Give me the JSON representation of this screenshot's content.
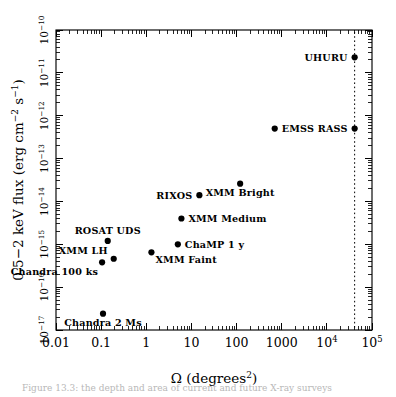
{
  "figure": {
    "background": "#ffffff",
    "ink_color": "#000000",
    "caption_fragment": "Figure  13.3:  the  depth  and  area  of  current  and  future  X-ray  surveys"
  },
  "chart_data": {
    "type": "scatter",
    "title": "",
    "xlabel": "Ω (degrees",
    "xlabel_sup": "2",
    "xlabel_tail": ")",
    "ylabel_prefix": "0.5−2 keV flux (erg cm",
    "ylabel_sup1": "−2",
    "ylabel_mid": " s",
    "ylabel_sup2": "−1",
    "ylabel_tail": ")",
    "xscale": "log",
    "yscale": "log",
    "xlim": [
      0.01,
      100000
    ],
    "ylim": [
      1e-17,
      1e-10
    ],
    "grid": false,
    "legend": false,
    "xticks": [
      {
        "value": 0.01,
        "label": "0.01",
        "sup": ""
      },
      {
        "value": 0.1,
        "label": "0.1",
        "sup": ""
      },
      {
        "value": 1,
        "label": "1",
        "sup": ""
      },
      {
        "value": 10,
        "label": "10",
        "sup": ""
      },
      {
        "value": 100,
        "label": "100",
        "sup": ""
      },
      {
        "value": 1000,
        "label": "1000",
        "sup": ""
      },
      {
        "value": 10000,
        "label": "10",
        "sup": "4"
      },
      {
        "value": 100000,
        "label": "10",
        "sup": "5"
      }
    ],
    "yticks": [
      {
        "value": 1e-17,
        "label": "10",
        "sup": "−17"
      },
      {
        "value": 1e-16,
        "label": "10",
        "sup": "−16"
      },
      {
        "value": 1e-15,
        "label": "10",
        "sup": "−15"
      },
      {
        "value": 1e-14,
        "label": "10",
        "sup": "−14"
      },
      {
        "value": 1e-13,
        "label": "10",
        "sup": "−13"
      },
      {
        "value": 1e-12,
        "label": "10",
        "sup": "−12"
      },
      {
        "value": 1e-11,
        "label": "10",
        "sup": "−11"
      },
      {
        "value": 1e-10,
        "label": "10",
        "sup": "−10"
      }
    ],
    "annotations": [
      {
        "name": "fullsky-line",
        "type": "vline",
        "x": 41253,
        "style": "dotted",
        "label": ""
      }
    ],
    "points": [
      {
        "name": "Chandra 2 Ms",
        "x": 0.11,
        "y": 2.4e-17,
        "label": "Chandra 2 Ms",
        "label_pos": "below"
      },
      {
        "name": "Chandra 100 ks",
        "x": 0.105,
        "y": 3.8e-16,
        "label": "Chandra 100 ks",
        "label_pos": "below-left"
      },
      {
        "name": "XMM LH",
        "x": 0.19,
        "y": 4.6e-16,
        "label": "XMM LH",
        "label_pos": "above-left"
      },
      {
        "name": "ROSAT UDS",
        "x": 0.14,
        "y": 1.2e-15,
        "label": "ROSAT UDS",
        "label_pos": "above"
      },
      {
        "name": "XMM Faint",
        "x": 1.3,
        "y": 6.5e-16,
        "label": "XMM Faint",
        "label_pos": "below-right"
      },
      {
        "name": "ChaMP 1 y",
        "x": 5.0,
        "y": 1e-15,
        "label": "ChaMP 1 y",
        "label_pos": "right"
      },
      {
        "name": "XMM Medium",
        "x": 6.0,
        "y": 4e-15,
        "label": "XMM Medium",
        "label_pos": "right"
      },
      {
        "name": "RIXOS",
        "x": 15.0,
        "y": 1.4e-14,
        "label": "RIXOS",
        "label_pos": "left"
      },
      {
        "name": "XMM Bright",
        "x": 120.0,
        "y": 2.6e-14,
        "label": "XMM Bright",
        "label_pos": "below"
      },
      {
        "name": "EMSS",
        "x": 700.0,
        "y": 5e-13,
        "label": "EMSS",
        "label_pos": "right"
      },
      {
        "name": "RASS",
        "x": 41253,
        "y": 5e-13,
        "label": "RASS",
        "label_pos": "left"
      },
      {
        "name": "UHURU",
        "x": 41253,
        "y": 2.3e-11,
        "label": "UHURU",
        "label_pos": "left"
      }
    ]
  }
}
